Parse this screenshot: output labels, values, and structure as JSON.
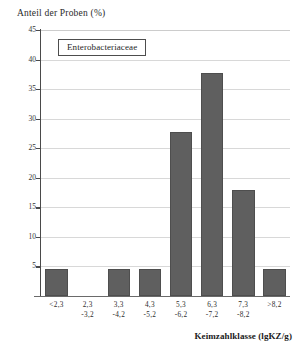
{
  "chart_data": {
    "type": "bar",
    "title": "",
    "legend_label": "Enterobacteriaceae",
    "legend_position": "top-left-inside",
    "grid": true,
    "ylabel": "Anteil der Proben (%)",
    "xlabel": "Keimzahlklasse (lgKZ/g)",
    "ylim": [
      0,
      45
    ],
    "yticks": [
      0,
      5,
      10,
      15,
      20,
      25,
      30,
      35,
      40,
      45
    ],
    "ytick_labels": [
      "",
      "5",
      "10",
      "15",
      "20",
      "25",
      "30",
      "35",
      "40",
      "45"
    ],
    "categories": [
      "<2,3",
      "2,3 -3,2",
      "3,3 -4,2",
      "4,3 -5,2",
      "5,3 -6,2",
      "6,3 -7,2",
      "7,3 -8,2",
      ">8,2"
    ],
    "category_lines": [
      {
        "line1": "<2,3",
        "line2": ""
      },
      {
        "line1": "2,3",
        "line2": "-3,2"
      },
      {
        "line1": "3,3",
        "line2": "-4,2"
      },
      {
        "line1": "4,3",
        "line2": "-5,2"
      },
      {
        "line1": "5,3",
        "line2": "-6,2"
      },
      {
        "line1": "6,3",
        "line2": "-7,2"
      },
      {
        "line1": "7,3",
        "line2": "-8,2"
      },
      {
        "line1": ">8,2",
        "line2": ""
      }
    ],
    "values": [
      4.5,
      0,
      4.5,
      4.5,
      27.8,
      37.8,
      18.0,
      4.5
    ],
    "bar_color": "#5f5f5f",
    "bar_edge_color": "#4e4e4e",
    "grid_color": "#d8d8d8",
    "axis_color": "#4a4a4a"
  }
}
